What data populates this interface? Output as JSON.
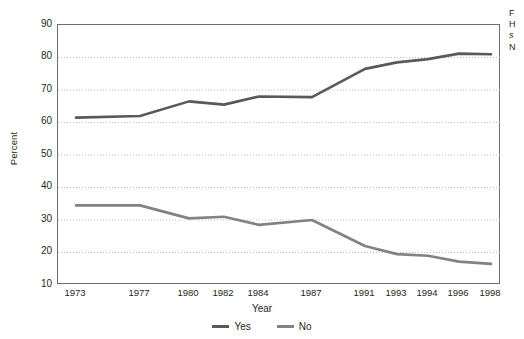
{
  "chart_data": {
    "type": "line",
    "title": "",
    "xlabel": "Year",
    "ylabel": "Percent",
    "x": [
      1973,
      1977,
      1980,
      1982,
      1984,
      1987,
      1991,
      1993,
      1994,
      1996,
      1998
    ],
    "categories": [
      "1973",
      "1977",
      "1980",
      "1982",
      "1984",
      "1987",
      "1991",
      "1993",
      "1994",
      "1996",
      "1998"
    ],
    "series": [
      {
        "name": "Yes",
        "color": "#58595b",
        "values": [
          61.5,
          62.0,
          66.5,
          65.5,
          68.0,
          67.8,
          76.5,
          78.5,
          79.5,
          81.2,
          81.0
        ]
      },
      {
        "name": "No",
        "color": "#808285",
        "values": [
          34.5,
          34.5,
          30.5,
          31.0,
          28.5,
          30.0,
          22.0,
          19.5,
          19.0,
          17.2,
          16.5
        ]
      }
    ],
    "ylim": [
      10,
      90
    ],
    "yticks": [
      10,
      20,
      30,
      40,
      50,
      60,
      70,
      80,
      90
    ],
    "ytick_labels": [
      "10",
      "20",
      "30",
      "40",
      "50",
      "60",
      "70",
      "80",
      "90"
    ],
    "grid": "horizontal-dotted",
    "legend_position": "bottom-center",
    "legend_entries": [
      "Yes",
      "No"
    ]
  },
  "axis": {
    "ylabel": "Percent",
    "xlabel": "Year",
    "ytick_labels": [
      "90",
      "80",
      "70",
      "60",
      "50",
      "40",
      "30",
      "20",
      "10"
    ],
    "xtick_labels": [
      "1973",
      "1977",
      "1980",
      "1982",
      "1984",
      "1987",
      "1991",
      "1993",
      "1994",
      "1996",
      "1998"
    ]
  },
  "legend": {
    "items": [
      {
        "label": "Yes",
        "color": "#58595b"
      },
      {
        "label": "No",
        "color": "#808285"
      }
    ]
  },
  "caption": {
    "lines": [
      "F",
      "H",
      "s",
      "N"
    ]
  },
  "colors": {
    "yes_line": "#58595b",
    "no_line": "#808285",
    "frame": "#6d6e71",
    "gridline": "#bcbec0",
    "text": "#231f20",
    "background": "#ffffff"
  }
}
